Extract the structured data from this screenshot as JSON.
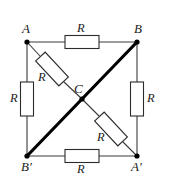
{
  "figure": {
    "type": "circuit-diagram",
    "background_color": "#ffffff",
    "wire_color": "#3a3a3a",
    "bold_wire_color": "#000000",
    "resistor_fill": "#ffffff",
    "resistor_stroke": "#2b2b2b",
    "label_color": "#1a1a1a"
  },
  "nodes": [
    {
      "id": "A",
      "label": "A",
      "x": 27,
      "y": 42,
      "label_x": 22,
      "label_y": 22
    },
    {
      "id": "B",
      "label": "B",
      "x": 137,
      "y": 42,
      "label_x": 134,
      "label_y": 22
    },
    {
      "id": "C",
      "label": "C",
      "x": 82,
      "y": 99,
      "label_x": 74,
      "label_y": 82
    },
    {
      "id": "Bp",
      "label": "B′",
      "x": 27,
      "y": 156,
      "label_x": 21,
      "label_y": 160
    },
    {
      "id": "Ap",
      "label": "A′",
      "x": 137,
      "y": 156,
      "label_x": 131,
      "label_y": 160
    }
  ],
  "edges": [
    {
      "id": "top",
      "from": "A",
      "to": "B",
      "style": "thin",
      "has_resistor": true
    },
    {
      "id": "left",
      "from": "A",
      "to": "Bp",
      "style": "thin",
      "has_resistor": true
    },
    {
      "id": "right",
      "from": "B",
      "to": "Ap",
      "style": "thin",
      "has_resistor": true
    },
    {
      "id": "bottom",
      "from": "Bp",
      "to": "Ap",
      "style": "thin",
      "has_resistor": true
    },
    {
      "id": "diag-a-c",
      "from": "A",
      "to": "C",
      "style": "thin",
      "has_resistor": true
    },
    {
      "id": "diag-c-ap",
      "from": "C",
      "to": "Ap",
      "style": "thin",
      "has_resistor": true
    },
    {
      "id": "diag-b-c",
      "from": "B",
      "to": "C",
      "style": "bold",
      "has_resistor": false
    },
    {
      "id": "diag-c-bp",
      "from": "C",
      "to": "Bp",
      "style": "bold",
      "has_resistor": false
    }
  ],
  "resistors": [
    {
      "id": "r-top",
      "label": "R",
      "cx": 82,
      "cy": 42,
      "w": 34,
      "h": 13,
      "rotation": 0,
      "label_x": 77,
      "label_y": 22
    },
    {
      "id": "r-left",
      "label": "R",
      "cx": 27,
      "cy": 99,
      "w": 13,
      "h": 34,
      "rotation": 0,
      "label_x": 10,
      "label_y": 92
    },
    {
      "id": "r-right",
      "label": "R",
      "cx": 137,
      "cy": 99,
      "w": 13,
      "h": 34,
      "rotation": 0,
      "label_x": 147,
      "label_y": 92
    },
    {
      "id": "r-bottom",
      "label": "R",
      "cx": 82,
      "cy": 156,
      "w": 34,
      "h": 13,
      "rotation": 0,
      "label_x": 77,
      "label_y": 163
    },
    {
      "id": "r-diag-upper",
      "label": "R",
      "cx": 52,
      "cy": 69,
      "w": 34,
      "h": 13,
      "rotation": 47,
      "label_x": 38,
      "label_y": 71
    },
    {
      "id": "r-diag-lower",
      "label": "R",
      "cx": 111,
      "cy": 129,
      "w": 34,
      "h": 13,
      "rotation": 47,
      "label_x": 97,
      "label_y": 131
    }
  ],
  "resistance_symbol": "R"
}
